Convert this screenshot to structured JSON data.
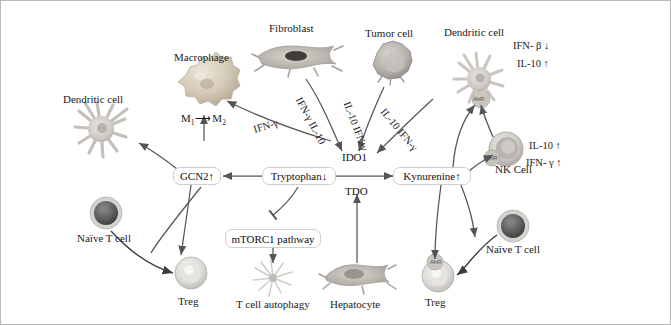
{
  "figure": {
    "type": "pathway-diagram",
    "background": "#ffffff",
    "border_color": "#b9b9b9",
    "arrow_color": "#555555"
  },
  "nodes": {
    "ido1": "IDO1",
    "tdo": "TDO",
    "tryptophan": "Tryptophan↓",
    "kynurenine": "Kynurenine↑",
    "gcn2": "GCN2↑",
    "mtorc1": "mTORC1 pathway"
  },
  "cells": {
    "dendritic_left": "Dendritic cell",
    "macrophage": "Macrophage",
    "macrophage_polarization": "M₁→M₂",
    "fibroblast": "Fibroblast",
    "tumor": "Tumor cell",
    "dendritic_right": "Dendritic cell",
    "nk": "NK Cell",
    "naive_t_left": "Naïve T cell",
    "naive_t_right": "Naïve T cell",
    "treg_left": "Treg",
    "treg_right": "Treg",
    "autophagy": "T cell autophagy",
    "hepatocyte": "Hepatocyte"
  },
  "receptors": {
    "dendritic_right_ahr": "AhR",
    "nk_ahr": "AhR",
    "treg_right_ahr": "AhR"
  },
  "arrow_labels": {
    "fibroblast_to_ido1": "IFN-γ IL-10",
    "macrophage_from": "IFN-γ",
    "tumor_to_ido1": "IL-10 IFN-γ",
    "tumor_to_ido1_b": "IL-10  IFN-γ"
  },
  "cytokines": {
    "dendritic_right": [
      "IFN- β ↓",
      "IL-10 ↑"
    ],
    "nk": [
      "IL-10 ↑",
      "IFN- γ ↑"
    ]
  }
}
